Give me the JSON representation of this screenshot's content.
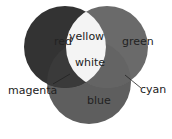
{
  "diagram": {
    "type": "venn",
    "circles": [
      {
        "name": "red",
        "cx": 65,
        "cy": 47,
        "r": 41,
        "fill": "#333333"
      },
      {
        "name": "green",
        "cx": 107,
        "cy": 47,
        "r": 41,
        "fill": "#6a6a6a"
      },
      {
        "name": "blue",
        "cx": 89,
        "cy": 82,
        "r": 42,
        "fill": "#5e5e5e"
      }
    ],
    "overlap_fill": {
      "red_green": "#f4f4f4",
      "red_blue": "#3a3a3a",
      "green_blue": "#646464"
    },
    "labels": {
      "red": "red",
      "green": "green",
      "blue": "blue",
      "yellow": "yellow",
      "white": "white",
      "magenta": "magenta",
      "cyan": "cyan"
    },
    "label_color": "#222222"
  }
}
